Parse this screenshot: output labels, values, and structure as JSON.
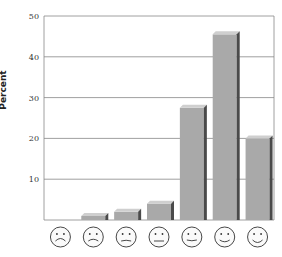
{
  "chart_data": {
    "type": "bar",
    "title": "",
    "xlabel": "",
    "ylabel": "Percent",
    "ylim": [
      0,
      50
    ],
    "yticks": [
      10,
      20,
      30,
      40,
      50
    ],
    "grid": true,
    "legend": null,
    "categories": [
      "very-sad-face",
      "sad-face",
      "slightly-sad-face",
      "neutral-face",
      "slightly-happy-face",
      "happy-face",
      "very-happy-face"
    ],
    "values": [
      0,
      1,
      2,
      4,
      27.5,
      45.5,
      20
    ],
    "colors": {
      "bar_face": "#a9a9a9",
      "bar_top": "#cfcfcf",
      "bar_side": "#4a4a4a",
      "grid": "#888888",
      "axis": "#888888"
    }
  }
}
